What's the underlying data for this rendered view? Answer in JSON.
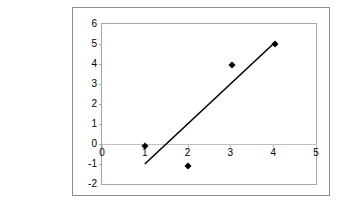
{
  "chart_data": {
    "type": "scatter",
    "title": "",
    "subtitle": "",
    "xlabel": "",
    "ylabel": "",
    "xlim": [
      0,
      5
    ],
    "ylim": [
      -2,
      6
    ],
    "grid": false,
    "legend": "none",
    "x_ticks": [
      "0",
      "1",
      "2",
      "3",
      "4",
      "5"
    ],
    "y_ticks": [
      "6",
      "5",
      "4",
      "3",
      "2",
      "1",
      "0",
      "-1",
      "-2"
    ],
    "x": [
      1,
      2,
      3,
      4
    ],
    "values": [
      0,
      -1,
      4,
      5
    ],
    "series": [
      {
        "name": "Series 1",
        "marker": "diamond",
        "color": "#000000",
        "points": [
          {
            "x": 1,
            "y": 0
          },
          {
            "x": 2,
            "y": -1
          },
          {
            "x": 3,
            "y": 4
          },
          {
            "x": 4,
            "y": 5
          }
        ]
      }
    ],
    "trendline": {
      "type": "linear",
      "color": "#000000",
      "start": {
        "x": 1,
        "y": -1
      },
      "end": {
        "x": 4,
        "y": 5
      },
      "slope": 2,
      "intercept": -3
    },
    "colors": {
      "frame_border": "#8d8d8d",
      "plot_border": "#a6a6a6",
      "zero_line": "#bfbfbf",
      "marker": "#000000",
      "trendline": "#000000",
      "background": "#ffffff"
    }
  }
}
